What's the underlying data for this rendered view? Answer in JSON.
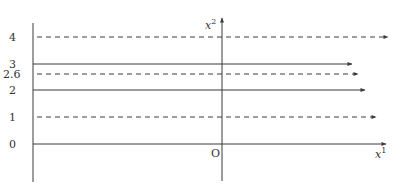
{
  "diagram": {
    "type": "parallel-flow-lines",
    "colors": {
      "line": "#3a3a3a",
      "text": "#333333",
      "background": "#ffffff"
    },
    "axes": {
      "horizontal": {
        "label_base": "x",
        "label_sup": "1",
        "origin_label": "O"
      },
      "vertical": {
        "label_base": "x",
        "label_sup": "2"
      }
    },
    "left_scale": {
      "tick_labels": [
        "4",
        "3",
        "2.6",
        "2",
        "1",
        "0"
      ]
    },
    "lines": [
      {
        "value": 4,
        "label": "4",
        "style": "dashed",
        "y": 37,
        "x_start": 37,
        "x_end": 388
      },
      {
        "value": 3,
        "label": "3",
        "style": "solid",
        "y": 64,
        "x_start": 33,
        "x_end": 352
      },
      {
        "value": 2.6,
        "label": "2.6",
        "style": "dashed",
        "y": 74,
        "x_start": 37,
        "x_end": 358
      },
      {
        "value": 2,
        "label": "2",
        "style": "solid",
        "y": 90,
        "x_start": 33,
        "x_end": 365
      },
      {
        "value": 1,
        "label": "1",
        "style": "dashed",
        "y": 117,
        "x_start": 37,
        "x_end": 376
      },
      {
        "value": 0,
        "label": "0",
        "style": "solid",
        "y": 144,
        "x_start": 33,
        "x_end": 386
      }
    ]
  }
}
